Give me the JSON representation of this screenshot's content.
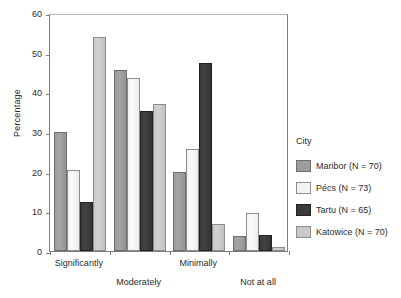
{
  "chart_data": {
    "type": "bar",
    "title": "",
    "xlabel": "",
    "ylabel": "Percentage",
    "ylim": [
      0,
      60
    ],
    "yticks": [
      0,
      10,
      20,
      30,
      40,
      50,
      60
    ],
    "grid": false,
    "legend_position": "right",
    "legend_title": "City",
    "categories": [
      "Significantly",
      "Moderately",
      "Minimally",
      "Not at all"
    ],
    "series": [
      {
        "name": "Maribor (N = 70)",
        "color": "#9d9d9d",
        "values": [
          30.0,
          45.7,
          20.0,
          3.7
        ]
      },
      {
        "name": "Pécs (N = 73)",
        "color": "#f4f4f4",
        "values": [
          20.5,
          43.5,
          25.8,
          9.5
        ]
      },
      {
        "name": "Tartu (N = 65)",
        "color": "#3a3a3a",
        "values": [
          12.3,
          35.3,
          47.5,
          4.0
        ]
      },
      {
        "name": "Katowice (N = 70)",
        "color": "#c9c9c9",
        "values": [
          54.0,
          37.0,
          6.8,
          1.0
        ]
      }
    ]
  }
}
